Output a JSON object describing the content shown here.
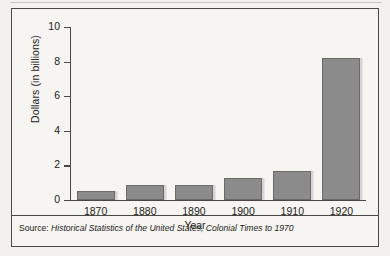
{
  "figure": {
    "source_label": "Source:",
    "source_title": "Historical Statistics of the United States, Colonial Times to 1970",
    "frame_color": "#4a4845",
    "bar_color": "#8b8b8b",
    "background_color": "#f6f5f2"
  },
  "chart_data": {
    "type": "bar",
    "title": "",
    "xlabel": "Year",
    "ylabel": "Dollars (in billions)",
    "categories": [
      "1870",
      "1880",
      "1890",
      "1900",
      "1910",
      "1920"
    ],
    "values": [
      0.5,
      0.85,
      0.85,
      1.3,
      1.7,
      8.2
    ],
    "ylim": [
      0,
      10
    ],
    "yticks": [
      0,
      2,
      4,
      6,
      8,
      10
    ],
    "ytick_labels": [
      "0",
      "2",
      "4",
      "6",
      "8",
      "10"
    ],
    "grid": false,
    "legend": false
  }
}
